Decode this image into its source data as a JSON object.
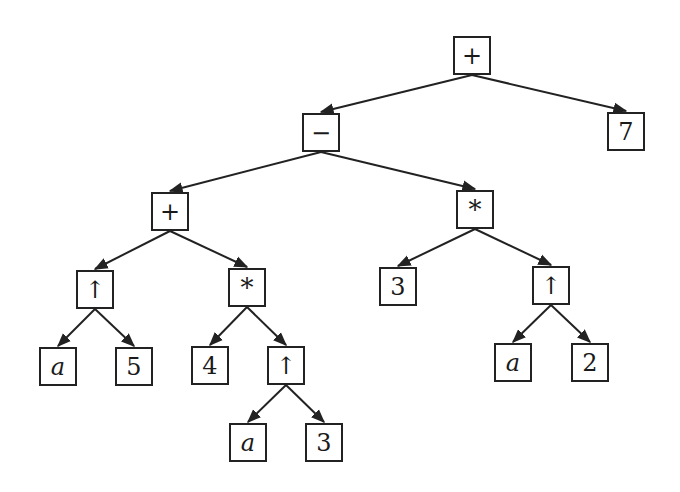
{
  "diagram": {
    "type": "expression-tree",
    "nodes": [
      {
        "id": "n0",
        "label": "+",
        "kind": "operator",
        "name": "plus",
        "x": 453,
        "y": 36
      },
      {
        "id": "n1",
        "label": "−",
        "kind": "operator",
        "name": "minus",
        "x": 302,
        "y": 113
      },
      {
        "id": "n2",
        "label": "7",
        "kind": "constant",
        "name": "seven",
        "x": 607,
        "y": 112
      },
      {
        "id": "n3",
        "label": "+",
        "kind": "operator",
        "name": "plus",
        "x": 151,
        "y": 192
      },
      {
        "id": "n4",
        "label": "*",
        "kind": "operator",
        "name": "times",
        "x": 456,
        "y": 190
      },
      {
        "id": "n5",
        "label": "↑",
        "kind": "operator",
        "name": "power",
        "x": 76,
        "y": 270
      },
      {
        "id": "n6",
        "label": "*",
        "kind": "operator",
        "name": "times",
        "x": 228,
        "y": 268
      },
      {
        "id": "n7",
        "label": "3",
        "kind": "constant",
        "name": "three",
        "x": 379,
        "y": 267
      },
      {
        "id": "n8",
        "label": "↑",
        "kind": "operator",
        "name": "power",
        "x": 532,
        "y": 266
      },
      {
        "id": "n9",
        "label": "a",
        "kind": "variable",
        "name": "a",
        "x": 39,
        "y": 347
      },
      {
        "id": "n10",
        "label": "5",
        "kind": "constant",
        "name": "five",
        "x": 115,
        "y": 347
      },
      {
        "id": "n11",
        "label": "4",
        "kind": "constant",
        "name": "four",
        "x": 191,
        "y": 346
      },
      {
        "id": "n12",
        "label": "↑",
        "kind": "operator",
        "name": "power",
        "x": 267,
        "y": 346
      },
      {
        "id": "n13",
        "label": "a",
        "kind": "variable",
        "name": "a",
        "x": 494,
        "y": 343
      },
      {
        "id": "n14",
        "label": "2",
        "kind": "constant",
        "name": "two",
        "x": 571,
        "y": 343
      },
      {
        "id": "n15",
        "label": "a",
        "kind": "variable",
        "name": "a",
        "x": 229,
        "y": 423
      },
      {
        "id": "n16",
        "label": "3",
        "kind": "constant",
        "name": "three",
        "x": 305,
        "y": 423
      }
    ],
    "edges": [
      [
        "n0",
        "n1"
      ],
      [
        "n0",
        "n2"
      ],
      [
        "n1",
        "n3"
      ],
      [
        "n1",
        "n4"
      ],
      [
        "n3",
        "n5"
      ],
      [
        "n3",
        "n6"
      ],
      [
        "n4",
        "n7"
      ],
      [
        "n4",
        "n8"
      ],
      [
        "n5",
        "n9"
      ],
      [
        "n5",
        "n10"
      ],
      [
        "n6",
        "n11"
      ],
      [
        "n6",
        "n12"
      ],
      [
        "n8",
        "n13"
      ],
      [
        "n8",
        "n14"
      ],
      [
        "n12",
        "n15"
      ],
      [
        "n12",
        "n16"
      ]
    ],
    "expression": "((a ↑ 5 + 4 * a ↑ 3) − 3 * a ↑ 2) + 7",
    "colors": {
      "stroke": "#222222",
      "background": "#ffffff",
      "text": "#1a1a1a"
    }
  }
}
